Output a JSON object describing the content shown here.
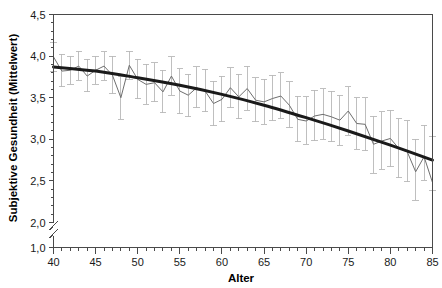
{
  "chart_data": {
    "type": "line",
    "title": "",
    "subtitle": "",
    "xlabel": "Alter",
    "ylabel": "Subjektive Gesundheit (Mittelwert)",
    "xlim": [
      40,
      85
    ],
    "ylim": [
      2.0,
      4.5
    ],
    "y_axis_break": {
      "present": true,
      "below_label": "1,0",
      "break_between": [
        1.0,
        2.0
      ]
    },
    "grid": false,
    "legend": null,
    "x_ticks_major": [
      40,
      45,
      50,
      55,
      60,
      65,
      70,
      75,
      80,
      85
    ],
    "x_tick_labels": [
      "40",
      "45",
      "50",
      "55",
      "60",
      "65",
      "70",
      "75",
      "80",
      "85"
    ],
    "x_minor_tick_step": 1,
    "y_ticks_major": [
      2.0,
      2.5,
      3.0,
      3.5,
      4.0,
      4.5
    ],
    "y_tick_labels": [
      "2,0",
      "2,5",
      "3,0",
      "3,5",
      "4,0",
      "4,5"
    ],
    "y_extra_tick": {
      "value": 1.0,
      "label": "1,0"
    },
    "y_minor_tick_step": 0.1,
    "colors": {
      "observed_line": "#6e6e6e",
      "error_bars": "#b8b8b8",
      "fit_curve": "#1a1a1a",
      "axis": "#4a4a4a",
      "text": "#000000"
    },
    "series": [
      {
        "name": "Mittelwert subjektive Gesundheit",
        "type": "line-with-errorbars",
        "x": [
          40,
          41,
          42,
          43,
          44,
          45,
          46,
          47,
          48,
          49,
          50,
          51,
          52,
          53,
          54,
          55,
          56,
          57,
          58,
          59,
          60,
          61,
          62,
          63,
          64,
          65,
          66,
          67,
          68,
          69,
          70,
          71,
          72,
          73,
          74,
          75,
          76,
          77,
          78,
          79,
          80,
          81,
          82,
          83,
          84,
          85
        ],
        "values": [
          3.99,
          3.82,
          3.83,
          3.88,
          3.76,
          3.83,
          3.88,
          3.77,
          3.5,
          3.89,
          3.72,
          3.66,
          3.68,
          3.57,
          3.76,
          3.58,
          3.53,
          3.62,
          3.58,
          3.43,
          3.48,
          3.62,
          3.51,
          3.61,
          3.47,
          3.45,
          3.49,
          3.52,
          3.41,
          3.24,
          3.22,
          3.28,
          3.3,
          3.27,
          3.23,
          3.34,
          3.19,
          3.18,
          2.94,
          2.98,
          3.01,
          2.89,
          2.85,
          2.61,
          2.79,
          2.48
        ],
        "err_upper": [
          4.16,
          4.02,
          4.0,
          4.06,
          3.96,
          4.0,
          4.05,
          4.0,
          3.76,
          4.06,
          3.96,
          3.9,
          3.92,
          3.83,
          3.99,
          3.85,
          3.78,
          3.87,
          3.84,
          3.7,
          3.76,
          3.86,
          3.78,
          3.88,
          3.74,
          3.72,
          3.77,
          3.8,
          3.69,
          3.52,
          3.51,
          3.59,
          3.61,
          3.58,
          3.53,
          3.63,
          3.5,
          3.5,
          3.28,
          3.33,
          3.35,
          3.25,
          3.22,
          3.0,
          3.17,
          3.03
        ],
        "err_lower": [
          3.82,
          3.63,
          3.66,
          3.71,
          3.57,
          3.66,
          3.71,
          3.55,
          3.24,
          3.72,
          3.49,
          3.42,
          3.45,
          3.32,
          3.53,
          3.31,
          3.27,
          3.38,
          3.33,
          3.16,
          3.21,
          3.38,
          3.25,
          3.35,
          3.21,
          3.18,
          3.22,
          3.25,
          3.14,
          2.97,
          2.94,
          2.98,
          3.0,
          2.97,
          2.93,
          3.05,
          2.88,
          2.86,
          2.59,
          2.64,
          2.67,
          2.54,
          2.49,
          2.27,
          2.51,
          2.39
        ]
      },
      {
        "name": "Quadratischer Trend (Regressionskurve)",
        "type": "fit-curve",
        "x": [
          40,
          45,
          50,
          55,
          60,
          65,
          70,
          75,
          80,
          85
        ],
        "values": [
          3.87,
          3.82,
          3.74,
          3.65,
          3.54,
          3.41,
          3.26,
          3.1,
          2.93,
          2.75
        ]
      }
    ]
  },
  "axes": {
    "x_title": "Alter",
    "y_title": "Subjektive Gesundheit (Mittelwert)"
  }
}
